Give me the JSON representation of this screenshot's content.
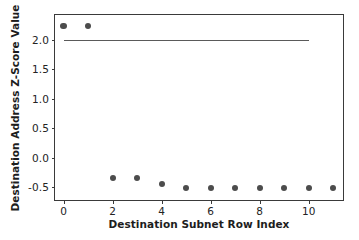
{
  "chart_data": {
    "type": "scatter",
    "title": "",
    "xlabel": "Destination Subnet Row Index",
    "ylabel": "Destination Address Z-Score Value",
    "x": [
      0,
      1,
      2,
      3,
      4,
      5,
      6,
      7,
      8,
      9,
      10,
      11
    ],
    "values": [
      2.23,
      2.23,
      -0.34,
      -0.34,
      -0.45,
      -0.51,
      -0.51,
      -0.51,
      -0.51,
      -0.51,
      -0.51,
      -0.51
    ],
    "series": [
      {
        "name": "Destination Address Z-Score",
        "marker": "circle",
        "color": "#4c4c4c",
        "values": [
          2.23,
          2.23,
          -0.34,
          -0.34,
          -0.45,
          -0.51,
          -0.51,
          -0.51,
          -0.51,
          -0.51,
          -0.51,
          -0.51
        ]
      }
    ],
    "annotations": [
      {
        "type": "hline",
        "name": "threshold-line",
        "y": 2.0,
        "x_start": 0,
        "x_end": 10,
        "color": "#5a5a5a"
      }
    ],
    "xlim": [
      -0.35,
      11.4
    ],
    "ylim": [
      -0.72,
      2.42
    ],
    "xticks": [
      0,
      2,
      4,
      6,
      8,
      10
    ],
    "xticklabels": [
      "0",
      "2",
      "4",
      "6",
      "8",
      "10"
    ],
    "yticks": [
      -0.5,
      0.0,
      0.5,
      1.0,
      1.5,
      2.0
    ],
    "yticklabels": [
      "-0.5",
      "0.0",
      "0.5",
      "1.0",
      "1.5",
      "2.0"
    ],
    "grid": false,
    "legend": null,
    "background": "#ffffff"
  }
}
